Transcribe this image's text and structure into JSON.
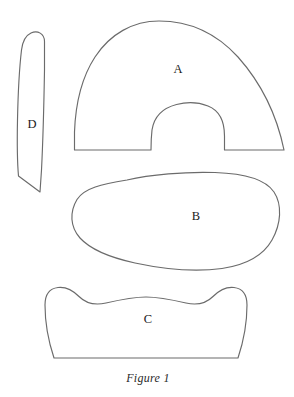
{
  "figure": {
    "caption": "Figure 1",
    "background_color": "#ffffff",
    "outline_color": "#6b6b6b",
    "label_color": "#1a1a1a",
    "width": 294,
    "height": 397
  },
  "pieces": [
    {
      "label": "A",
      "name": "arch-piece",
      "description": "large arch with semicircular notch cut into flat bottom edge",
      "label_x": 178,
      "label_y": 70
    },
    {
      "label": "B",
      "name": "blob-piece",
      "description": "asymmetric rounded closed blob",
      "label_x": 196,
      "label_y": 217
    },
    {
      "label": "C",
      "name": "wavy-top-piece",
      "description": "trapezoid with wavy scalloped top and flat bottom",
      "label_x": 148,
      "label_y": 320
    },
    {
      "label": "D",
      "name": "sliver-piece",
      "description": "narrow elongated sliver, rounded top, angled bottom",
      "label_x": 32,
      "label_y": 125
    }
  ]
}
